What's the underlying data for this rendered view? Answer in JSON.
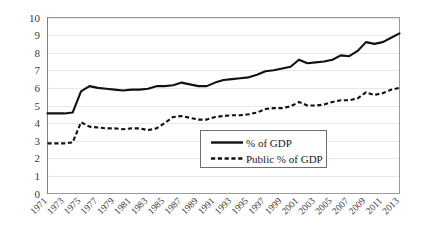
{
  "chart_data": {
    "type": "line",
    "title": "",
    "xlabel": "",
    "ylabel": "",
    "ylim": [
      0,
      10
    ],
    "xlim": [
      1971,
      2013
    ],
    "grid": true,
    "legend_position": "inside-lower-center-right",
    "ytick_labels": [
      "0",
      "1",
      "2",
      "3",
      "4",
      "5",
      "6",
      "7",
      "8",
      "9",
      "10"
    ],
    "ytick_values": [
      0,
      1,
      2,
      3,
      4,
      5,
      6,
      7,
      8,
      9,
      10
    ],
    "x": [
      1971,
      1972,
      1973,
      1974,
      1975,
      1976,
      1977,
      1978,
      1979,
      1980,
      1981,
      1982,
      1983,
      1984,
      1985,
      1986,
      1987,
      1988,
      1989,
      1990,
      1991,
      1992,
      1993,
      1994,
      1995,
      1996,
      1997,
      1998,
      1999,
      2000,
      2001,
      2002,
      2003,
      2004,
      2005,
      2006,
      2007,
      2008,
      2009,
      2010,
      2011,
      2012,
      2013
    ],
    "xtick_labels": [
      "1971",
      "1973",
      "1975",
      "1977",
      "1979",
      "1981",
      "1983",
      "1985",
      "1987",
      "1989",
      "1991",
      "1993",
      "1995",
      "1997",
      "1999",
      "2001",
      "2003",
      "2005",
      "2007",
      "2009",
      "2011",
      "2013"
    ],
    "xtick_values": [
      1971,
      1973,
      1975,
      1977,
      1979,
      1981,
      1983,
      1985,
      1987,
      1989,
      1991,
      1993,
      1995,
      1997,
      1999,
      2001,
      2003,
      2005,
      2007,
      2009,
      2011,
      2013
    ],
    "series": [
      {
        "name": "% of GDP",
        "style": "solid",
        "color": "#111111",
        "values": [
          4.55,
          4.55,
          4.55,
          4.6,
          5.8,
          6.1,
          6.0,
          5.95,
          5.9,
          5.85,
          5.9,
          5.9,
          5.95,
          6.1,
          6.1,
          6.15,
          6.3,
          6.2,
          6.1,
          6.1,
          6.3,
          6.45,
          6.5,
          6.55,
          6.6,
          6.75,
          6.95,
          7.0,
          7.1,
          7.2,
          7.6,
          7.4,
          7.45,
          7.5,
          7.6,
          7.85,
          7.8,
          8.1,
          8.6,
          8.5,
          8.6,
          8.85,
          9.1
        ]
      },
      {
        "name": "Public % of GDP",
        "style": "dashed",
        "color": "#111111",
        "values": [
          2.85,
          2.85,
          2.85,
          2.9,
          4.05,
          3.8,
          3.75,
          3.7,
          3.7,
          3.65,
          3.7,
          3.7,
          3.6,
          3.7,
          4.0,
          4.35,
          4.4,
          4.3,
          4.2,
          4.2,
          4.35,
          4.4,
          4.45,
          4.45,
          4.5,
          4.6,
          4.8,
          4.85,
          4.85,
          4.95,
          5.2,
          5.0,
          5.0,
          5.05,
          5.2,
          5.3,
          5.3,
          5.4,
          5.75,
          5.6,
          5.7,
          5.9,
          6.0
        ]
      }
    ]
  },
  "legend": {
    "entries": [
      {
        "label": "% of GDP",
        "style": "solid"
      },
      {
        "label": "Public % of GDP",
        "style": "dashed"
      }
    ]
  }
}
